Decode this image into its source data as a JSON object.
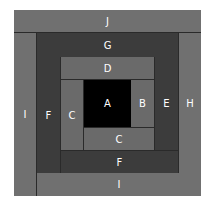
{
  "diagram": {
    "type": "log-cabin-quilt-block",
    "pieces": {
      "J": "J",
      "I_left": "I",
      "I_bottom": "I",
      "H": "H",
      "G": "G",
      "F_left": "F",
      "F_bottom": "F",
      "E": "E",
      "D": "D",
      "C_left": "C",
      "C_bottom": "C",
      "B": "B",
      "A": "A"
    },
    "colors": {
      "outer_ring": "#707070",
      "middle_ring": "#3c3c3c",
      "inner_ring": "#6a6a6a",
      "center": "#000000"
    }
  }
}
